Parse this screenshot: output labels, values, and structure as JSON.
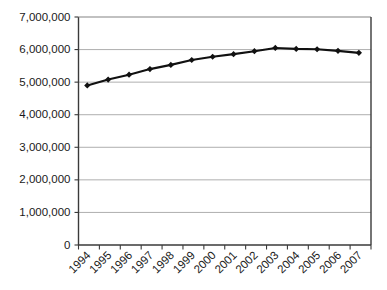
{
  "chart_data": {
    "type": "line",
    "title": "",
    "subtitle": "",
    "xlabel": "",
    "ylabel": "",
    "categories": [
      "1994",
      "1995",
      "1996",
      "1997",
      "1998",
      "1999",
      "2000",
      "2001",
      "2002",
      "2003",
      "2004",
      "2005",
      "2006",
      "2007"
    ],
    "values": [
      4900000,
      5080000,
      5230000,
      5400000,
      5530000,
      5680000,
      5780000,
      5860000,
      5950000,
      6050000,
      6020000,
      6010000,
      5960000,
      5900000
    ],
    "series": [
      {
        "name": "",
        "values": [
          4900000,
          5080000,
          5230000,
          5400000,
          5530000,
          5680000,
          5780000,
          5860000,
          5950000,
          6050000,
          6020000,
          6010000,
          5960000,
          5900000
        ]
      }
    ],
    "ylim": [
      0,
      7000000
    ],
    "ytick_values": [
      0,
      1000000,
      2000000,
      3000000,
      4000000,
      5000000,
      6000000,
      7000000
    ],
    "ytick_labels": [
      "0",
      "1,000,000",
      "2,000,000",
      "3,000,000",
      "4,000,000",
      "5,000,000",
      "6,000,000",
      "7,000,000"
    ],
    "xtick_labels": [
      "1994",
      "1995",
      "1996",
      "1997",
      "1998",
      "1999",
      "2000",
      "2001",
      "2002",
      "2003",
      "2004",
      "2005",
      "2006",
      "2007"
    ],
    "xtick_label_rotation": -45,
    "grid": {
      "horizontal": true,
      "vertical": false,
      "color": "#a6a6a6"
    },
    "legend": {
      "visible": false,
      "position": "none",
      "entries": []
    },
    "marker": {
      "shape": "diamond",
      "color": "#111111"
    },
    "line_color": "#111111",
    "background_color": "#ffffff",
    "axis_color": "#3a3a3a",
    "annotations": []
  }
}
